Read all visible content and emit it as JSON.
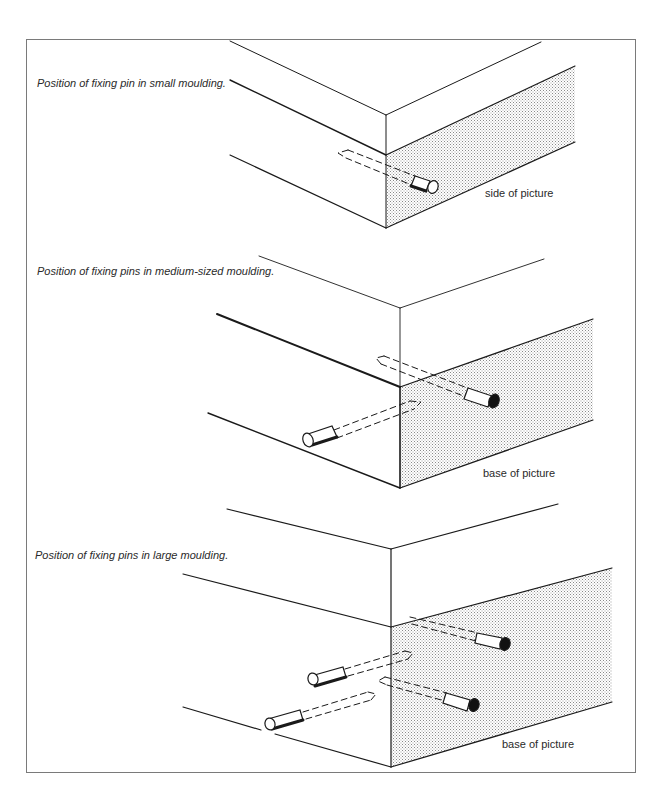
{
  "figures": [
    {
      "caption": "Position of fixing pin in small moulding.",
      "face_label": "side of picture",
      "pin_count": 1
    },
    {
      "caption": "Position of fixing pins in medium-sized moulding.",
      "face_label": "base of picture",
      "pin_count": 2
    },
    {
      "caption": "Position of fixing pins in large moulding.",
      "face_label": "base of picture",
      "pin_count": 4
    }
  ],
  "colors": {
    "line": "#1a1a1a",
    "frame": "#7a7a7a",
    "stipple": "#9a9a9a"
  }
}
